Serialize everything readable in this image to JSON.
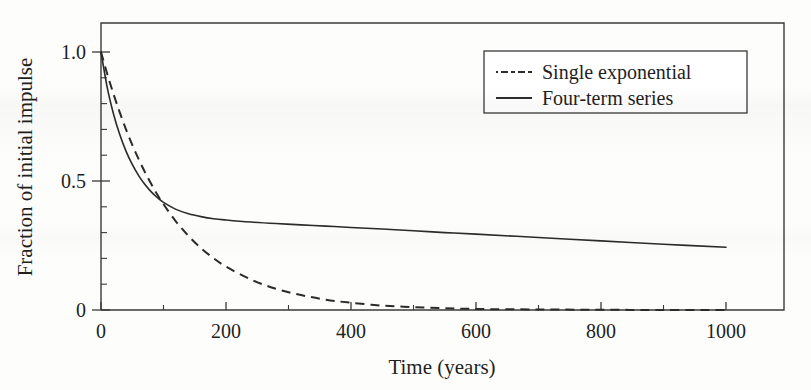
{
  "chart_data": {
    "type": "line",
    "title": "",
    "xlabel": "Time (years)",
    "ylabel": "Fraction of initial impulse",
    "xlim": [
      0,
      1000
    ],
    "ylim": [
      0,
      1.0
    ],
    "grid": false,
    "legend_position": "upper-right",
    "x_ticks_major": [
      0,
      200,
      400,
      600,
      800,
      1000
    ],
    "x_tick_labels": [
      "0",
      "200",
      "400",
      "600",
      "800",
      "1000"
    ],
    "x_ticks_minor": [
      100,
      300,
      500,
      700,
      900
    ],
    "y_ticks_major": [
      0,
      0.5,
      1.0
    ],
    "y_tick_labels": [
      "0",
      "0.5",
      "1.0"
    ],
    "y_ticks_minor": [
      0.1,
      0.2,
      0.3,
      0.4,
      0.6,
      0.7,
      0.8,
      0.9
    ],
    "x": [
      0,
      10,
      20,
      30,
      40,
      50,
      60,
      70,
      80,
      90,
      100,
      120,
      140,
      160,
      180,
      200,
      240,
      280,
      320,
      360,
      400,
      450,
      500,
      550,
      600,
      700,
      800,
      900,
      1000
    ],
    "series": [
      {
        "name": "Single exponential",
        "style": "dashed",
        "color": "#2b2b2b",
        "values": [
          1.0,
          0.915,
          0.837,
          0.766,
          0.7,
          0.64,
          0.586,
          0.536,
          0.49,
          0.448,
          0.41,
          0.343,
          0.287,
          0.24,
          0.201,
          0.168,
          0.118,
          0.082,
          0.058,
          0.04,
          0.028,
          0.017,
          0.011,
          0.007,
          0.004,
          0.002,
          0.001,
          0.0,
          0.0
        ]
      },
      {
        "name": "Four-term series",
        "style": "solid",
        "color": "#2b2b2b",
        "values": [
          1.0,
          0.862,
          0.76,
          0.68,
          0.616,
          0.564,
          0.522,
          0.487,
          0.459,
          0.436,
          0.417,
          0.39,
          0.373,
          0.362,
          0.354,
          0.349,
          0.341,
          0.335,
          0.33,
          0.325,
          0.32,
          0.314,
          0.307,
          0.3,
          0.294,
          0.281,
          0.268,
          0.255,
          0.243
        ]
      }
    ],
    "annotations": []
  },
  "legend": {
    "entries": [
      {
        "label": "Single exponential",
        "style": "dashed"
      },
      {
        "label": "Four-term series",
        "style": "solid"
      }
    ]
  }
}
